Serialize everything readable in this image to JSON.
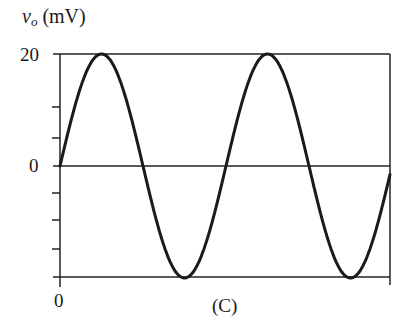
{
  "chart_data": {
    "type": "line",
    "title": "",
    "caption": "(C)",
    "ylabel_symbol": "v",
    "ylabel_subscript": "o",
    "ylabel_unit": "(mV)",
    "xlabel": "",
    "y_tick_labels": [
      "20",
      "0"
    ],
    "x_tick_labels": [
      "0"
    ],
    "ylim": [
      -20,
      20
    ],
    "y_minor_ticks": [
      20,
      13.3,
      6.7,
      0,
      -6.7,
      -13.3,
      -20
    ],
    "grid": false,
    "series": [
      {
        "name": "v_o",
        "function": "20*sin(2*pi*t/T)",
        "amplitude_mV": 20,
        "cycles_shown": 2,
        "start_phase": "0 (rising through zero at t=0)",
        "points": [
          {
            "t": 0,
            "v": 0
          },
          {
            "t": 0.25,
            "v": 20
          },
          {
            "t": 0.5,
            "v": 0
          },
          {
            "t": 0.75,
            "v": -20
          },
          {
            "t": 1.0,
            "v": 0
          },
          {
            "t": 1.25,
            "v": 20
          },
          {
            "t": 1.5,
            "v": 0
          },
          {
            "t": 1.75,
            "v": -20
          },
          {
            "t": 1.99,
            "v": -2.5
          }
        ]
      }
    ]
  },
  "labels": {
    "y_symbol": "v",
    "y_sub": "o",
    "y_unit": "(mV)",
    "y_top": "20",
    "y_zero": "0",
    "x_zero": "0",
    "caption": "(C)"
  }
}
